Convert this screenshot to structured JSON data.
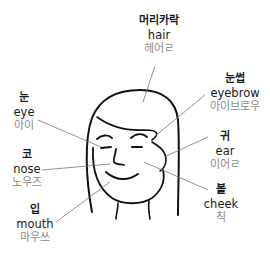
{
  "diagram": {
    "line_color": "#111111",
    "leader_color": "#666666",
    "pronunciation_color": "#8a8a8a",
    "labels": [
      {
        "id": "hair",
        "korean": "머리카락",
        "english": "hair",
        "pronunciation": "헤어ㄹ"
      },
      {
        "id": "eyebrow",
        "korean": "눈썹",
        "english": "eyebrow",
        "pronunciation": "아이브로우"
      },
      {
        "id": "eye",
        "korean": "눈",
        "english": "eye",
        "pronunciation": "아이"
      },
      {
        "id": "ear",
        "korean": "귀",
        "english": "ear",
        "pronunciation": "이어ㄹ"
      },
      {
        "id": "nose",
        "korean": "코",
        "english": "nose",
        "pronunciation": "노우즈"
      },
      {
        "id": "cheek",
        "korean": "볼",
        "english": "cheek",
        "pronunciation": "칙"
      },
      {
        "id": "mouth",
        "korean": "입",
        "english": "mouth",
        "pronunciation": "마우쓰"
      }
    ]
  }
}
